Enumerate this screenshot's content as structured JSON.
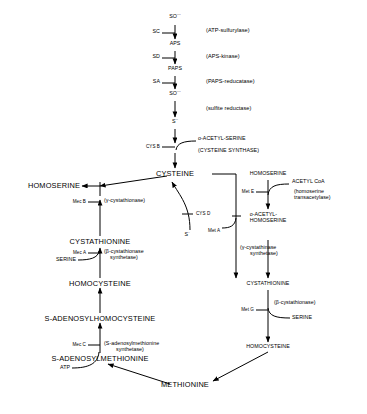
{
  "diagram": {
    "metabolites": {
      "sulfate": "SO",
      "sulfate_sup": "---",
      "sulfate_sub": "4",
      "aps": "APS",
      "paps": "PAPS",
      "sulfite": "SO",
      "sulfite_sup": "---",
      "sulfite_sub": "3",
      "sulfide": "S",
      "sulfide_sup": "--",
      "cysteine": "CYSTEINE",
      "homoserine_left": "HOMOSERINE",
      "cystathionine_left": "CYSTATHIONINE",
      "serine_left": "SERINE",
      "homocysteine_left": "HOMOCYSTEINE",
      "sah": "S-ADENOSYLHOMOCYSTEINE",
      "sam": "S-ADENOSYLMETHIONINE",
      "atp": "ATP",
      "methionine": "METHIONINE",
      "homoserine_right": "HOMOSERINE",
      "acetyl_coa": "ACETYL CoA",
      "o_acetyl_homoserine_1": "o-ACETYL-",
      "o_acetyl_homoserine_2": "HOMOSERINE",
      "cystathionine_right": "CYSTATHIONINE",
      "serine_right": "SERINE",
      "homocysteine_right": "HOMOCYSTEINE",
      "o_acetyl_serine": "o-ACETYL-SERINE",
      "sulfide_branch": "S",
      "sulfide_branch_sup": "-"
    },
    "enzymes": {
      "atp_sulfurylase": "(ATP-sulfurylase)",
      "aps_kinase": "(APS-kinase)",
      "paps_reductase": "(PAPS-reducatase)",
      "sulfite_reductase": "(sulfite reductase)",
      "cysteine_synthase": "(CYSTEINE SYNTHASE)",
      "gamma_cystathionase": "(γ-cystathionase)",
      "beta_cystathionase_synthetase_1": "(β-cystathionase",
      "beta_cystathionase_synthetase_2": "synthetase)",
      "sam_synthetase_1": "(S-adenosylmethionine",
      "sam_synthetase_2": "synthetase)",
      "homoserine_transacetylase_1": "(homoserine",
      "homoserine_transacetylase_2": "transacetylase)",
      "gamma_cystathinase_synthetase_1": "(γ-cystathinase",
      "gamma_cystathinase_synthetase_2": "synthetase)",
      "beta_cystathionase": "(β-cystathionase)"
    },
    "genes": {
      "sc": "SC",
      "sd": "SD",
      "sa": "SA",
      "cys_b": "CYS B",
      "cys_d": "CYS D",
      "mec_b": "Mec B",
      "mec_a": "Mec A",
      "mec_c": "Mec C",
      "met_e": "Met E",
      "met_a": "Met A",
      "met_g": "Met G"
    }
  }
}
